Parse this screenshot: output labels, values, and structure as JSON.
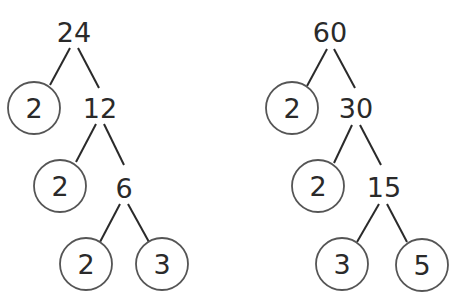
{
  "trees": [
    {
      "root": "24",
      "nodes": [
        {
          "id": "n24",
          "value": "24",
          "x": 74,
          "y": 32,
          "circled": false
        },
        {
          "id": "n2a",
          "value": "2",
          "x": 34,
          "y": 108,
          "circled": true
        },
        {
          "id": "n12",
          "value": "12",
          "x": 100,
          "y": 108,
          "circled": false
        },
        {
          "id": "n2b",
          "value": "2",
          "x": 60,
          "y": 186,
          "circled": true
        },
        {
          "id": "n6",
          "value": "6",
          "x": 124,
          "y": 188,
          "circled": false
        },
        {
          "id": "n2c",
          "value": "2",
          "x": 86,
          "y": 264,
          "circled": true
        },
        {
          "id": "n3",
          "value": "3",
          "x": 162,
          "y": 264,
          "circled": true
        }
      ],
      "edges": [
        [
          70,
          48,
          50,
          85
        ],
        [
          78,
          48,
          99,
          88
        ],
        [
          96,
          124,
          76,
          162
        ],
        [
          104,
          124,
          124,
          165
        ],
        [
          120,
          204,
          100,
          242
        ],
        [
          128,
          204,
          149,
          242
        ]
      ]
    },
    {
      "root": "60",
      "nodes": [
        {
          "id": "n60",
          "value": "60",
          "x": 330,
          "y": 32,
          "circled": false
        },
        {
          "id": "n2d",
          "value": "2",
          "x": 292,
          "y": 108,
          "circled": true
        },
        {
          "id": "n30",
          "value": "30",
          "x": 356,
          "y": 108,
          "circled": false
        },
        {
          "id": "n2e",
          "value": "2",
          "x": 318,
          "y": 186,
          "circled": true
        },
        {
          "id": "n15",
          "value": "15",
          "x": 384,
          "y": 187,
          "circled": false
        },
        {
          "id": "n3b",
          "value": "3",
          "x": 342,
          "y": 264,
          "circled": true
        },
        {
          "id": "n5",
          "value": "5",
          "x": 422,
          "y": 265,
          "circled": true
        }
      ],
      "edges": [
        [
          327,
          49,
          307,
          86
        ],
        [
          334,
          49,
          355,
          88
        ],
        [
          352,
          125,
          334,
          163
        ],
        [
          360,
          125,
          381,
          165
        ],
        [
          379,
          204,
          357,
          242
        ],
        [
          387,
          204,
          407,
          242
        ]
      ]
    }
  ],
  "style": {
    "stroke": "#2a2a2a",
    "circle_stroke": "#555555",
    "circle_radius": 26
  }
}
